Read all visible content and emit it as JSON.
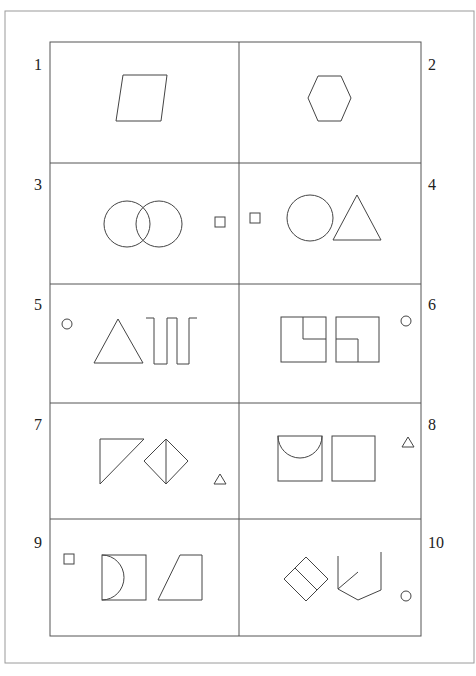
{
  "figure": {
    "type": "shape-puzzle-grid",
    "layout": "5 rows x 2 columns",
    "panels": [
      {
        "number": "1",
        "contents": [
          "parallelogram"
        ]
      },
      {
        "number": "2",
        "contents": [
          "hexagon"
        ]
      },
      {
        "number": "3",
        "contents": [
          "two overlapping circles",
          "small square"
        ]
      },
      {
        "number": "4",
        "contents": [
          "small square",
          "circle",
          "triangle"
        ]
      },
      {
        "number": "5",
        "contents": [
          "small circle",
          "triangle",
          "square-wave line"
        ]
      },
      {
        "number": "6",
        "contents": [
          "square with inner corner square (top-right)",
          "square with inner corner square (bottom-left)",
          "small circle"
        ]
      },
      {
        "number": "7",
        "contents": [
          "right triangle",
          "diamond split vertically",
          "small triangle"
        ]
      },
      {
        "number": "8",
        "contents": [
          "square with semicircle",
          "square",
          "small triangle"
        ]
      },
      {
        "number": "9",
        "contents": [
          "small square",
          "square with semicircle on left side",
          "right trapezoid"
        ]
      },
      {
        "number": "10",
        "contents": [
          "tilted rectangle split in two",
          "open polyline with spoke",
          "small circle"
        ]
      }
    ]
  },
  "colors": {
    "background": "#ffffff",
    "line": "#444444",
    "frame": "#9a9a9a"
  }
}
